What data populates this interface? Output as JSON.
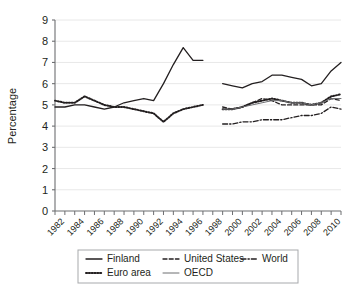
{
  "chart_data": {
    "type": "line",
    "title": "",
    "xlabel": "",
    "ylabel": "Percentage",
    "ylim": [
      0,
      9
    ],
    "xlim": [
      1981,
      2010
    ],
    "grid": true,
    "legend_position": "bottom",
    "y_ticks": [
      "0",
      "1",
      "2",
      "3",
      "4",
      "5",
      "6",
      "7",
      "8",
      "9"
    ],
    "x_ticks": [
      "1982",
      "1984",
      "1986",
      "1988",
      "1990",
      "1992",
      "1994",
      "1996",
      "1998",
      "2000",
      "2002",
      "2004",
      "2006",
      "2008",
      "2010"
    ],
    "x_all_years": [
      1981,
      1982,
      1983,
      1984,
      1985,
      1986,
      1987,
      1988,
      1989,
      1990,
      1991,
      1992,
      1993,
      1994,
      1995,
      1996,
      1997,
      1998,
      1999,
      2000,
      2001,
      2002,
      2003,
      2004,
      2005,
      2006,
      2007,
      2008,
      2009,
      2010
    ],
    "series": [
      {
        "name": "Finland",
        "style": "solid",
        "color": "#231f20",
        "x": [
          1981,
          1982,
          1983,
          1984,
          1985,
          1986,
          1987,
          1988,
          1989,
          1990,
          1991,
          1992,
          1993,
          1994,
          1995,
          1996
        ],
        "values": [
          4.9,
          4.9,
          5.0,
          5.0,
          4.9,
          4.8,
          4.9,
          5.1,
          5.2,
          5.3,
          5.2,
          6.0,
          6.9,
          7.7,
          7.1,
          7.1
        ]
      },
      {
        "name": "Euro area",
        "style": "dotted",
        "color": "#231f20",
        "x": [
          1981,
          1982,
          1983,
          1984,
          1985,
          1986,
          1987,
          1988,
          1989,
          1990,
          1991,
          1992,
          1993,
          1994,
          1995,
          1996
        ],
        "values": [
          5.2,
          5.1,
          5.1,
          5.4,
          5.2,
          5.0,
          4.9,
          4.9,
          4.8,
          4.7,
          4.6,
          4.2,
          4.6,
          4.8,
          4.9,
          5.0
        ]
      },
      {
        "name": "Finland",
        "style": "solid",
        "color": "#231f20",
        "x": [
          1998,
          1999,
          2000,
          2001,
          2002,
          2003,
          2004,
          2005,
          2006,
          2007,
          2008,
          2009,
          2010
        ],
        "values": [
          6.0,
          5.9,
          5.8,
          6.0,
          6.1,
          6.4,
          6.4,
          6.3,
          6.2,
          5.9,
          6.0,
          6.6,
          7.0
        ]
      },
      {
        "name": "Euro area",
        "style": "dotted",
        "color": "#231f20",
        "x": [
          1998,
          1999,
          2000,
          2001,
          2002,
          2003,
          2004,
          2005,
          2006,
          2007,
          2008,
          2009,
          2010
        ],
        "values": [
          4.8,
          4.8,
          4.9,
          5.1,
          5.2,
          5.3,
          5.2,
          5.1,
          5.1,
          5.0,
          5.1,
          5.4,
          5.5
        ]
      },
      {
        "name": "United States",
        "style": "dashed",
        "color": "#231f20",
        "x": [
          1998,
          1999,
          2000,
          2001,
          2002,
          2003,
          2004,
          2005,
          2006,
          2007,
          2008,
          2009,
          2010
        ],
        "values": [
          4.9,
          4.8,
          4.9,
          5.1,
          5.3,
          5.2,
          5.0,
          5.0,
          5.0,
          5.0,
          5.0,
          5.3,
          5.2
        ]
      },
      {
        "name": "OECD",
        "style": "solid-thin",
        "color": "#6d6e71",
        "x": [
          1998,
          1999,
          2000,
          2001,
          2002,
          2003,
          2004,
          2005,
          2006,
          2007,
          2008,
          2009,
          2010
        ],
        "values": [
          4.8,
          4.8,
          4.9,
          5.0,
          5.1,
          5.2,
          5.2,
          5.1,
          5.1,
          5.0,
          5.1,
          5.3,
          5.3
        ]
      },
      {
        "name": "World",
        "style": "dashdot",
        "color": "#231f20",
        "x": [
          1998,
          1999,
          2000,
          2001,
          2002,
          2003,
          2004,
          2005,
          2006,
          2007,
          2008,
          2009,
          2010
        ],
        "values": [
          4.1,
          4.1,
          4.2,
          4.2,
          4.3,
          4.3,
          4.3,
          4.4,
          4.5,
          4.5,
          4.6,
          4.9,
          4.8
        ]
      }
    ],
    "legend": [
      {
        "label": "Finland",
        "style": "solid"
      },
      {
        "label": "United States",
        "style": "dashed"
      },
      {
        "label": "World",
        "style": "dashdot"
      },
      {
        "label": "Euro area",
        "style": "dotted"
      },
      {
        "label": "OECD",
        "style": "solid-thin"
      }
    ]
  }
}
